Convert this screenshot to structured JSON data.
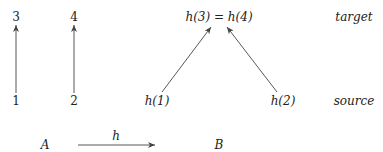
{
  "left_diagram": {
    "nodes": [
      {
        "id": "n3",
        "label": "3",
        "x": 16,
        "y": 21
      },
      {
        "id": "n4",
        "label": "4",
        "x": 74,
        "y": 21
      },
      {
        "id": "n1",
        "label": "1",
        "x": 16,
        "y": 105
      },
      {
        "id": "n2",
        "label": "2",
        "x": 74,
        "y": 105
      }
    ],
    "edges": [
      {
        "from": "1",
        "to": "3"
      },
      {
        "from": "2",
        "to": "4"
      }
    ]
  },
  "right_diagram": {
    "top_node": {
      "label": "h(3) = h(4)"
    },
    "bottom_left": {
      "label": "h(1)"
    },
    "bottom_right": {
      "label": "h(2)"
    },
    "edges": [
      {
        "from": "h(1)",
        "to": "h(3) = h(4)"
      },
      {
        "from": "h(2)",
        "to": "h(3) = h(4)"
      }
    ]
  },
  "row_labels": {
    "target": "target",
    "source": "source"
  },
  "mapping": {
    "domain": "A",
    "codomain": "B",
    "map_label": "h"
  }
}
